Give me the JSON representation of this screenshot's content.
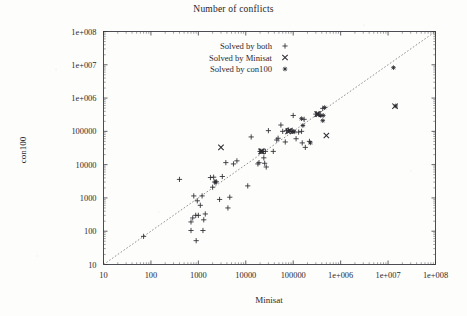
{
  "chart_data": {
    "type": "scatter",
    "title": "Number of conflicts",
    "xlabel": "Minisat",
    "ylabel": "con100",
    "xscale": "log",
    "yscale": "log",
    "xlim": [
      10,
      100000000
    ],
    "ylim": [
      10,
      100000000
    ],
    "grid": false,
    "legend_position": "top-left-inside",
    "xticks": [
      10,
      100,
      1000,
      10000,
      100000,
      1000000,
      10000000,
      100000000
    ],
    "xtick_labels": [
      "10",
      "100",
      "1000",
      "10000",
      "100000",
      "1e+006",
      "1e+007",
      "1e+008"
    ],
    "yticks": [
      10,
      100,
      1000,
      10000,
      100000,
      1000000,
      10000000,
      100000000
    ],
    "ytick_labels": [
      "10",
      "100",
      "1000",
      "10000",
      "100000",
      "1e+006",
      "1e+007",
      "1e+008"
    ],
    "annotations": [
      {
        "type": "reference-line",
        "label": "y = x diagonal",
        "style": "dashed",
        "from": [
          10,
          10
        ],
        "to": [
          100000000,
          100000000
        ]
      }
    ],
    "series": [
      {
        "name": "Solved by both",
        "marker": "plus",
        "color": "#2a2a30",
        "points": [
          [
            70,
            70
          ],
          [
            400,
            3600
          ],
          [
            700,
            190
          ],
          [
            700,
            105
          ],
          [
            760,
            250
          ],
          [
            800,
            1150
          ],
          [
            880,
            300
          ],
          [
            900,
            52
          ],
          [
            950,
            820
          ],
          [
            1000,
            300
          ],
          [
            1100,
            600
          ],
          [
            1200,
            1150
          ],
          [
            1250,
            105
          ],
          [
            1300,
            220
          ],
          [
            1400,
            330
          ],
          [
            1800,
            4100
          ],
          [
            2000,
            2100
          ],
          [
            2100,
            4200
          ],
          [
            2200,
            3000
          ],
          [
            2400,
            3050
          ],
          [
            2800,
            900
          ],
          [
            3200,
            4400
          ],
          [
            3800,
            11500
          ],
          [
            4200,
            500
          ],
          [
            4600,
            1050
          ],
          [
            5500,
            10500
          ],
          [
            6500,
            13000
          ],
          [
            11000,
            2300
          ],
          [
            13000,
            68000
          ],
          [
            18000,
            10500
          ],
          [
            19000,
            11500
          ],
          [
            20000,
            25000
          ],
          [
            21000,
            25000
          ],
          [
            23000,
            25000
          ],
          [
            24000,
            16000
          ],
          [
            25000,
            11000
          ],
          [
            26000,
            25000
          ],
          [
            27000,
            8500
          ],
          [
            30000,
            105000
          ],
          [
            38000,
            25000
          ],
          [
            45000,
            55000
          ],
          [
            48000,
            62000
          ],
          [
            55000,
            155000
          ],
          [
            60000,
            100000
          ],
          [
            68000,
            48000
          ],
          [
            72000,
            105000
          ],
          [
            80000,
            110000
          ],
          [
            90000,
            100000
          ],
          [
            95000,
            100000
          ],
          [
            100000,
            300000
          ],
          [
            115000,
            60000
          ],
          [
            130000,
            95000
          ],
          [
            150000,
            100000
          ],
          [
            155000,
            45000
          ],
          [
            170000,
            230000
          ],
          [
            180000,
            33000
          ],
          [
            220000,
            50000
          ],
          [
            300000,
            330000
          ],
          [
            340000,
            330000
          ],
          [
            420000,
            490000
          ]
        ]
      },
      {
        "name": "Solved by Minisat",
        "marker": "cross",
        "color": "#2a2a30",
        "points": [
          [
            3000,
            33000
          ],
          [
            21000,
            25000
          ],
          [
            22000,
            25000
          ],
          [
            78000,
            100000
          ],
          [
            85000,
            105000
          ],
          [
            320000,
            330000
          ],
          [
            340000,
            330000
          ],
          [
            500000,
            75000
          ],
          [
            14000000,
            570000
          ]
        ]
      },
      {
        "name": "Solved by con100",
        "marker": "star",
        "color": "#2a2a30",
        "points": [
          [
            2300,
            3000
          ],
          [
            100000,
            100000
          ],
          [
            105000,
            97000
          ],
          [
            150000,
            240000
          ],
          [
            160000,
            150000
          ],
          [
            230000,
            45000
          ],
          [
            380000,
            300000
          ],
          [
            420000,
            210000
          ],
          [
            430000,
            300000
          ],
          [
            460000,
            520000
          ],
          [
            13000000,
            8200000
          ],
          [
            14500000,
            580000
          ]
        ]
      }
    ]
  },
  "legend": {
    "items": [
      {
        "label": "Solved by both",
        "marker": "plus"
      },
      {
        "label": "Solved by Minisat",
        "marker": "cross"
      },
      {
        "label": "Solved by con100",
        "marker": "star"
      }
    ]
  }
}
